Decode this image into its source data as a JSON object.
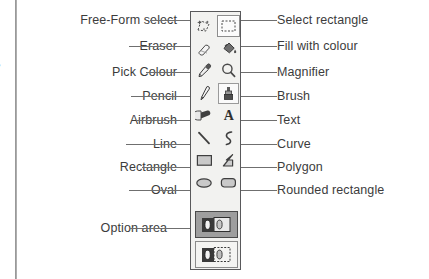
{
  "diagram": {
    "left_labels": [
      {
        "id": "free-form-select",
        "text": "Free-Form select"
      },
      {
        "id": "eraser",
        "text": "Eraser"
      },
      {
        "id": "pick-colour",
        "text": "Pick Colour"
      },
      {
        "id": "pencil",
        "text": "Pencil"
      },
      {
        "id": "airbrush",
        "text": "Airbrush"
      },
      {
        "id": "line",
        "text": "Line"
      },
      {
        "id": "rectangle",
        "text": "Rectangle"
      },
      {
        "id": "oval",
        "text": "Oval"
      },
      {
        "id": "option-area",
        "text": "Option area"
      }
    ],
    "right_labels": [
      {
        "id": "select-rectangle",
        "text": "Select rectangle"
      },
      {
        "id": "fill-with-colour",
        "text": "Fill with colour"
      },
      {
        "id": "magnifier",
        "text": "Magnifier"
      },
      {
        "id": "brush",
        "text": "Brush"
      },
      {
        "id": "text",
        "text": "Text"
      },
      {
        "id": "curve",
        "text": "Curve"
      },
      {
        "id": "polygon",
        "text": "Polygon"
      },
      {
        "id": "rounded-rectangle",
        "text": "Rounded rectangle"
      }
    ],
    "toolbox": {
      "tools": [
        {
          "row": 1,
          "col": "left",
          "icon": "free-form-select-icon",
          "name": "Free-Form select",
          "state": "normal"
        },
        {
          "row": 1,
          "col": "right",
          "icon": "select-rectangle-icon",
          "name": "Select rectangle",
          "state": "selected"
        },
        {
          "row": 2,
          "col": "left",
          "icon": "eraser-icon",
          "name": "Eraser",
          "state": "normal"
        },
        {
          "row": 2,
          "col": "right",
          "icon": "fill-bucket-icon",
          "name": "Fill with colour",
          "state": "normal"
        },
        {
          "row": 3,
          "col": "left",
          "icon": "eyedropper-icon",
          "name": "Pick Colour",
          "state": "normal"
        },
        {
          "row": 3,
          "col": "right",
          "icon": "magnifier-icon",
          "name": "Magnifier",
          "state": "normal"
        },
        {
          "row": 4,
          "col": "left",
          "icon": "pencil-icon",
          "name": "Pencil",
          "state": "normal"
        },
        {
          "row": 4,
          "col": "right",
          "icon": "brush-icon",
          "name": "Brush",
          "state": "raised"
        },
        {
          "row": 5,
          "col": "left",
          "icon": "airbrush-icon",
          "name": "Airbrush",
          "state": "normal"
        },
        {
          "row": 5,
          "col": "right",
          "icon": "text-icon",
          "name": "Text",
          "state": "normal"
        },
        {
          "row": 6,
          "col": "left",
          "icon": "line-icon",
          "name": "Line",
          "state": "normal"
        },
        {
          "row": 6,
          "col": "right",
          "icon": "curve-icon",
          "name": "Curve",
          "state": "normal"
        },
        {
          "row": 7,
          "col": "left",
          "icon": "rectangle-icon",
          "name": "Rectangle",
          "state": "normal"
        },
        {
          "row": 7,
          "col": "right",
          "icon": "polygon-icon",
          "name": "Polygon",
          "state": "normal"
        },
        {
          "row": 8,
          "col": "left",
          "icon": "oval-icon",
          "name": "Oval",
          "state": "normal"
        },
        {
          "row": 8,
          "col": "right",
          "icon": "rounded-rectangle-icon",
          "name": "Rounded rectangle",
          "state": "normal"
        }
      ],
      "option_buttons": [
        {
          "id": "opaque-option",
          "icon": "opaque-selection-icon",
          "state": "selected"
        },
        {
          "id": "transparent-option",
          "icon": "transparent-selection-icon",
          "state": "normal"
        }
      ]
    },
    "text_icon_glyph": "A",
    "margin_glyph": "•",
    "colors": {
      "page_background": "#ffffff",
      "toolbox_background": "#f2f2f0",
      "toolbox_border": "#59595b",
      "label_text": "#3c3c3c",
      "leader_line": "#6f6f6f",
      "margin_rule": "#8e8e8e",
      "option_selected": "#9e9e9e"
    }
  }
}
